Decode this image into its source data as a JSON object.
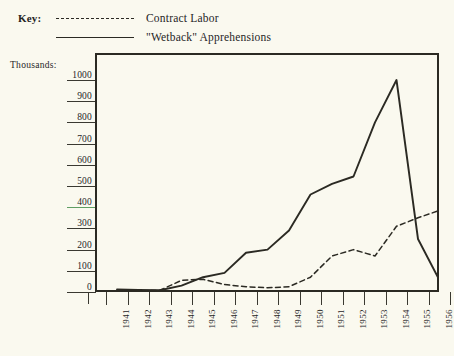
{
  "legend": {
    "key_label": "Key:",
    "entries": [
      {
        "style": "dashed",
        "label": "Contract Labor"
      },
      {
        "style": "solid",
        "label": "\"Wetback\" Apprehensions"
      }
    ]
  },
  "axis": {
    "y_caption": "Thousands:",
    "y_ticks": [
      "1000",
      "900",
      "800",
      "700",
      "600",
      "500",
      "400",
      "300",
      "200",
      "100",
      "0"
    ],
    "x_ticks": [
      "1941",
      "1942",
      "1943",
      "1944",
      "1945",
      "1946",
      "1947",
      "1948",
      "1949",
      "1950",
      "1951",
      "1952",
      "1953",
      "1954",
      "1955",
      "1956"
    ]
  },
  "colors": {
    "background": "#faf9ef",
    "ink": "#2b2a23",
    "accent_rule": "#5f9e63"
  },
  "chart_data": {
    "type": "line",
    "title": "",
    "xlabel": "",
    "ylabel": "Thousands:",
    "grid": false,
    "legend_position": "above-plot",
    "ylim": [
      0,
      1000
    ],
    "yticks": [
      0,
      100,
      200,
      300,
      400,
      500,
      600,
      700,
      800,
      900,
      1000
    ],
    "x": [
      1941,
      1942,
      1943,
      1944,
      1945,
      1946,
      1947,
      1948,
      1949,
      1950,
      1951,
      1952,
      1953,
      1954,
      1955,
      1956
    ],
    "series": [
      {
        "name": "\"Wetback\" Apprehensions",
        "style": "solid",
        "values": [
          12,
          10,
          8,
          30,
          70,
          90,
          185,
          200,
          290,
          460,
          510,
          545,
          800,
          1000,
          250,
          55
        ]
      },
      {
        "name": "Contract Labor",
        "style": "dashed",
        "values": [
          5,
          5,
          8,
          55,
          60,
          35,
          25,
          20,
          25,
          70,
          170,
          200,
          170,
          310,
          350,
          385
        ]
      }
    ]
  }
}
